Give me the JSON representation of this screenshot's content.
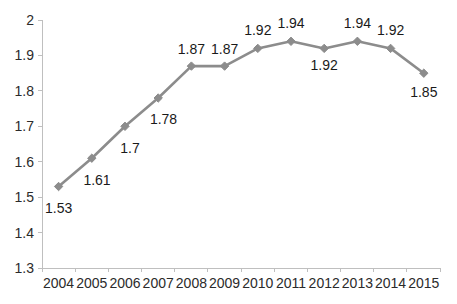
{
  "chart_data": {
    "type": "line",
    "title": "",
    "subtitle": "",
    "xlabel": "",
    "ylabel": "",
    "categories": [
      "2004",
      "2005",
      "2006",
      "2007",
      "2008",
      "2009",
      "2010",
      "2011",
      "2012",
      "2013",
      "2014",
      "2015"
    ],
    "values": [
      1.53,
      1.61,
      1.7,
      1.78,
      1.87,
      1.87,
      1.92,
      1.94,
      1.92,
      1.94,
      1.92,
      1.85
    ],
    "point_labels": [
      "1.53",
      "1.61",
      "1.7",
      "1.78",
      "1.87",
      "1.87",
      "1.92",
      "1.94",
      "1.92",
      "1.94",
      "1.92",
      "1.85"
    ],
    "ylim": [
      1.3,
      2.0
    ],
    "y_ticks": [
      2,
      1.9,
      1.8,
      1.7,
      1.6,
      1.5,
      1.4,
      1.3
    ],
    "y_tick_labels": [
      "2",
      "1.9",
      "1.8",
      "1.7",
      "1.6",
      "1.5",
      "1.4",
      "1.3"
    ],
    "grid": false,
    "legend": "none",
    "series_color": "#8c8c8c",
    "axis_color": "#bfbfbf",
    "label_color": "#1a1a1a",
    "marker": "diamond"
  },
  "y_axis": {
    "labels": [
      {
        "text": "2",
        "y": 20
      },
      {
        "text": "1.9",
        "y": 55.4
      },
      {
        "text": "1.8",
        "y": 90.9
      },
      {
        "text": "1.7",
        "y": 126.3
      },
      {
        "text": "1.6",
        "y": 161.7
      },
      {
        "text": "1.5",
        "y": 197.1
      },
      {
        "text": "1.4",
        "y": 232.6
      },
      {
        "text": "1.3",
        "y": 268
      }
    ]
  },
  "x_axis": {
    "labels": [
      {
        "text": "2004",
        "x": 58.6
      },
      {
        "text": "2005",
        "x": 91.8
      },
      {
        "text": "2006",
        "x": 125.0
      },
      {
        "text": "2007",
        "x": 158.2
      },
      {
        "text": "2008",
        "x": 191.4
      },
      {
        "text": "2009",
        "x": 224.6
      },
      {
        "text": "2010",
        "x": 257.8
      },
      {
        "text": "2011",
        "x": 291.0
      },
      {
        "text": "2012",
        "x": 324.2
      },
      {
        "text": "2013",
        "x": 357.4
      },
      {
        "text": "2014",
        "x": 390.6
      },
      {
        "text": "2015",
        "x": 423.8
      }
    ]
  },
  "points": [
    {
      "year": "2004",
      "value": "1.53",
      "x": 58.6,
      "y": 186.5,
      "lx": 58.6,
      "ly": 213
    },
    {
      "year": "2005",
      "value": "1.61",
      "x": 91.8,
      "y": 158.2,
      "lx": 97.0,
      "ly": 185
    },
    {
      "year": "2006",
      "value": "1.7",
      "x": 125.0,
      "y": 126.3,
      "lx": 130.0,
      "ly": 153
    },
    {
      "year": "2007",
      "value": "1.78",
      "x": 158.2,
      "y": 98.0,
      "lx": 163.5,
      "ly": 124
    },
    {
      "year": "2008",
      "value": "1.87",
      "x": 191.4,
      "y": 66.1,
      "lx": 191.4,
      "ly": 54
    },
    {
      "year": "2009",
      "value": "1.87",
      "x": 224.6,
      "y": 66.1,
      "lx": 224.6,
      "ly": 54
    },
    {
      "year": "2010",
      "value": "1.92",
      "x": 257.8,
      "y": 48.4,
      "lx": 257.8,
      "ly": 35
    },
    {
      "year": "2011",
      "value": "1.94",
      "x": 291.0,
      "y": 41.3,
      "lx": 291.0,
      "ly": 28
    },
    {
      "year": "2012",
      "value": "1.92",
      "x": 324.2,
      "y": 48.4,
      "lx": 324.2,
      "ly": 70
    },
    {
      "year": "2013",
      "value": "1.94",
      "x": 357.4,
      "y": 41.3,
      "lx": 357.4,
      "ly": 28
    },
    {
      "year": "2014",
      "value": "1.92",
      "x": 390.6,
      "y": 48.4,
      "lx": 390.6,
      "ly": 35
    },
    {
      "year": "2015",
      "value": "1.85",
      "x": 423.8,
      "y": 73.2,
      "lx": 423.8,
      "ly": 97
    }
  ],
  "plot_area": {
    "left": 42,
    "right": 440,
    "top": 20,
    "bottom": 268
  }
}
